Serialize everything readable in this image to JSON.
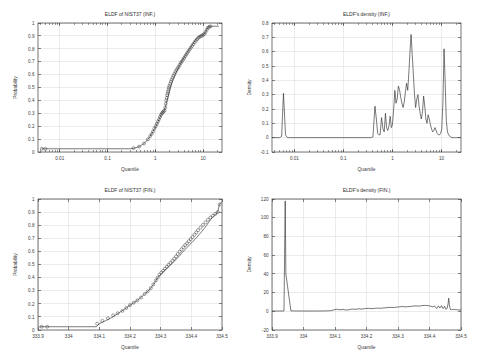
{
  "figure": {
    "width": 477,
    "height": 362,
    "background": "#ffffff",
    "line_color": "#303030",
    "grid_color": "#d8d8d8",
    "axis_color": "#3a3a3a",
    "text_color": "#3c3c3c"
  },
  "chart_data": [
    {
      "id": "ecdf-inf",
      "type": "line",
      "title": "ELDF of NIST37 (INF.)",
      "xlabel": "Quantile",
      "ylabel": "Probability",
      "xscale": "log",
      "yscale": "linear",
      "xlim": [
        0.0035,
        25
      ],
      "ylim": [
        0,
        1
      ],
      "grid": true,
      "xticks": [
        0.01,
        0.1,
        1,
        10
      ],
      "xtick_labels": [
        "0.01",
        "0.1",
        "1",
        "10"
      ],
      "yticks": [
        0,
        0.1,
        0.2,
        0.3,
        0.4,
        0.5,
        0.6,
        0.7,
        0.8,
        0.9,
        1
      ],
      "ytick_labels": [
        "0",
        "0.1",
        "0.2",
        "0.3",
        "0.4",
        "0.5",
        "0.6",
        "0.7",
        "0.8",
        "0.9",
        "1"
      ],
      "legend": null,
      "series": [
        {
          "name": "ECDF step curve",
          "style": "line",
          "x": [
            0.0042,
            0.0048,
            0.006,
            0.0075,
            0.3,
            0.34,
            0.38,
            0.42,
            0.46,
            0.5,
            0.54,
            0.58,
            0.62,
            0.66,
            0.7,
            0.74,
            0.78,
            0.82,
            0.86,
            0.9,
            0.95,
            1.0,
            1.05,
            1.1,
            1.16,
            1.22,
            1.28,
            1.34,
            1.4,
            1.47,
            1.54,
            1.62,
            1.7,
            1.78,
            1.87,
            1.96,
            2.05,
            2.15,
            2.26,
            2.37,
            2.49,
            2.61,
            2.74,
            2.88,
            3.02,
            3.17,
            3.33,
            3.5,
            3.67,
            3.86,
            4.05,
            4.25,
            4.47,
            4.69,
            4.93,
            5.17,
            5.43,
            5.71,
            6.0,
            6.3,
            6.62,
            6.95,
            7.3,
            7.67,
            8.06,
            8.47,
            8.9,
            9.35,
            9.83,
            10.33,
            10.85,
            11.4,
            11.98,
            12.59,
            13.23,
            13.9,
            14.6,
            15.34,
            16.12,
            18.5,
            21.0
          ],
          "y": [
            0.025,
            0.025,
            0.025,
            0.025,
            0.025,
            0.028,
            0.032,
            0.037,
            0.042,
            0.05,
            0.058,
            0.066,
            0.075,
            0.086,
            0.098,
            0.11,
            0.122,
            0.134,
            0.148,
            0.16,
            0.175,
            0.19,
            0.205,
            0.222,
            0.24,
            0.258,
            0.276,
            0.293,
            0.305,
            0.312,
            0.32,
            0.345,
            0.375,
            0.405,
            0.432,
            0.46,
            0.49,
            0.515,
            0.54,
            0.562,
            0.58,
            0.6,
            0.618,
            0.635,
            0.65,
            0.665,
            0.68,
            0.695,
            0.71,
            0.722,
            0.735,
            0.748,
            0.76,
            0.772,
            0.785,
            0.797,
            0.808,
            0.82,
            0.832,
            0.845,
            0.856,
            0.868,
            0.878,
            0.886,
            0.892,
            0.897,
            0.9,
            0.903,
            0.906,
            0.912,
            0.92,
            0.935,
            0.952,
            0.966,
            0.972,
            0.974,
            0.975,
            0.975,
            0.975,
            0.975,
            0.975
          ]
        },
        {
          "name": "ECDF sample markers",
          "style": "markers",
          "marker": "circle",
          "x": [
            0.0042,
            0.005,
            0.35,
            0.46,
            0.58,
            0.7,
            0.78,
            0.84,
            0.9,
            0.96,
            1.02,
            1.08,
            1.14,
            1.2,
            1.26,
            1.32,
            1.38,
            1.44,
            1.5,
            1.56,
            1.62,
            1.66,
            1.7,
            1.74,
            1.78,
            1.82,
            1.86,
            1.9,
            1.94,
            1.98,
            2.05,
            2.12,
            2.2,
            2.3,
            2.4,
            2.52,
            2.64,
            2.78,
            2.92,
            3.08,
            3.25,
            3.42,
            3.6,
            3.8,
            4.0,
            4.22,
            4.45,
            4.7,
            4.95,
            5.25,
            5.55,
            5.9,
            6.25,
            6.65,
            7.05,
            7.5,
            7.95,
            8.45,
            9.0,
            9.55,
            10.1,
            10.7,
            11.3,
            12.0,
            12.7,
            13.5,
            14.3
          ],
          "y": [
            0.025,
            0.025,
            0.03,
            0.042,
            0.066,
            0.098,
            0.122,
            0.14,
            0.16,
            0.182,
            0.2,
            0.218,
            0.236,
            0.254,
            0.272,
            0.288,
            0.3,
            0.308,
            0.315,
            0.322,
            0.345,
            0.375,
            0.4,
            0.42,
            0.44,
            0.455,
            0.47,
            0.485,
            0.5,
            0.512,
            0.528,
            0.545,
            0.56,
            0.575,
            0.59,
            0.605,
            0.62,
            0.635,
            0.648,
            0.66,
            0.675,
            0.69,
            0.702,
            0.715,
            0.728,
            0.742,
            0.755,
            0.768,
            0.782,
            0.795,
            0.808,
            0.822,
            0.836,
            0.85,
            0.862,
            0.874,
            0.884,
            0.892,
            0.898,
            0.902,
            0.908,
            0.916,
            0.93,
            0.948,
            0.962,
            0.97,
            0.974
          ]
        }
      ]
    },
    {
      "id": "density-inf",
      "type": "line",
      "title": "ELDF's density (INF.)",
      "xlabel": "Quantile",
      "ylabel": "Density",
      "xscale": "log",
      "yscale": "linear",
      "xlim": [
        0.0035,
        25
      ],
      "ylim": [
        -0.1,
        0.8
      ],
      "grid": true,
      "xticks": [
        0.01,
        0.1,
        1,
        10
      ],
      "xtick_labels": [
        "0.01",
        "0.1",
        "1",
        "10"
      ],
      "yticks": [
        -0.1,
        0,
        0.1,
        0.2,
        0.3,
        0.4,
        0.5,
        0.6,
        0.7,
        0.8
      ],
      "ytick_labels": [
        "-0.1",
        "0",
        "0.1",
        "0.2",
        "0.3",
        "0.4",
        "0.5",
        "0.6",
        "0.7",
        "0.8"
      ],
      "legend": null,
      "series": [
        {
          "name": "kernel density",
          "style": "line",
          "x": [
            0.0036,
            0.005,
            0.0055,
            0.006,
            0.0066,
            0.0072,
            0.008,
            0.01,
            0.02,
            0.05,
            0.1,
            0.2,
            0.3,
            0.36,
            0.4,
            0.44,
            0.47,
            0.5,
            0.53,
            0.56,
            0.6,
            0.64,
            0.68,
            0.72,
            0.76,
            0.8,
            0.85,
            0.9,
            0.95,
            1.0,
            1.06,
            1.12,
            1.18,
            1.25,
            1.32,
            1.4,
            1.48,
            1.56,
            1.65,
            1.74,
            1.84,
            1.94,
            2.05,
            2.16,
            2.28,
            2.4,
            2.53,
            2.67,
            2.82,
            2.97,
            3.14,
            3.31,
            3.49,
            3.68,
            3.88,
            4.1,
            4.32,
            4.56,
            4.81,
            5.07,
            5.35,
            5.64,
            5.95,
            6.28,
            6.62,
            6.98,
            7.36,
            7.77,
            8.19,
            8.64,
            9.11,
            9.61,
            10.14,
            10.7,
            11.28,
            11.9,
            12.55,
            13.24,
            13.97,
            14.73,
            15.54,
            16.39,
            17.29,
            18.23,
            19.23,
            20.5,
            22.0,
            24.0
          ],
          "y": [
            0.0,
            0.0,
            0.01,
            0.31,
            0.02,
            0.0,
            0.0,
            0.0,
            0.0,
            0.0,
            0.0,
            0.0,
            0.0,
            0.0,
            0.005,
            0.22,
            0.13,
            0.03,
            0.02,
            0.02,
            0.14,
            0.06,
            0.04,
            0.17,
            0.07,
            0.05,
            0.08,
            0.15,
            0.07,
            0.09,
            0.2,
            0.33,
            0.24,
            0.27,
            0.36,
            0.33,
            0.28,
            0.24,
            0.21,
            0.25,
            0.32,
            0.38,
            0.33,
            0.45,
            0.6,
            0.72,
            0.58,
            0.44,
            0.3,
            0.21,
            0.27,
            0.3,
            0.22,
            0.17,
            0.13,
            0.18,
            0.29,
            0.22,
            0.13,
            0.1,
            0.16,
            0.13,
            0.09,
            0.06,
            0.04,
            0.05,
            0.07,
            0.05,
            0.03,
            0.02,
            0.02,
            0.03,
            0.06,
            0.25,
            0.62,
            0.38,
            0.12,
            0.04,
            0.02,
            0.01,
            0.005,
            0.0,
            0.0,
            0.0,
            0.0,
            0.0,
            0.0,
            0.0
          ]
        }
      ]
    },
    {
      "id": "ecdf-fin",
      "type": "line",
      "title": "ELDF of NIST37 (FIN.)",
      "xlabel": "Quantile",
      "ylabel": "Probability",
      "xscale": "linear",
      "yscale": "linear",
      "xlim": [
        333.9,
        334.5
      ],
      "ylim": [
        0,
        1
      ],
      "grid": true,
      "xticks": [
        333.9,
        334.0,
        334.1,
        334.2,
        334.3,
        334.4,
        334.5
      ],
      "xtick_labels": [
        "333.9",
        "334",
        "334.1",
        "334.2",
        "334.3",
        "334.4",
        "334.5"
      ],
      "yticks": [
        0,
        0.1,
        0.2,
        0.3,
        0.4,
        0.5,
        0.6,
        0.7,
        0.8,
        0.9,
        1
      ],
      "ytick_labels": [
        "0",
        "0.1",
        "0.2",
        "0.3",
        "0.4",
        "0.5",
        "0.6",
        "0.7",
        "0.8",
        "0.9",
        "1"
      ],
      "legend": null,
      "series": [
        {
          "name": "ECDF step curve",
          "style": "line",
          "x": [
            333.905,
            333.92,
            333.935,
            334.09,
            334.1,
            334.11,
            334.12,
            334.13,
            334.14,
            334.15,
            334.16,
            334.17,
            334.18,
            334.19,
            334.2,
            334.21,
            334.22,
            334.23,
            334.24,
            334.25,
            334.258,
            334.266,
            334.274,
            334.282,
            334.29,
            334.298,
            334.306,
            334.314,
            334.322,
            334.33,
            334.338,
            334.346,
            334.354,
            334.362,
            334.37,
            334.378,
            334.386,
            334.394,
            334.402,
            334.41,
            334.418,
            334.426,
            334.434,
            334.442,
            334.45,
            334.456,
            334.462,
            334.468,
            334.474,
            334.48,
            334.486,
            334.492,
            334.498
          ],
          "y": [
            0.025,
            0.025,
            0.025,
            0.025,
            0.048,
            0.06,
            0.07,
            0.082,
            0.095,
            0.11,
            0.125,
            0.14,
            0.155,
            0.172,
            0.19,
            0.205,
            0.22,
            0.238,
            0.258,
            0.28,
            0.295,
            0.315,
            0.34,
            0.368,
            0.398,
            0.42,
            0.44,
            0.458,
            0.475,
            0.492,
            0.51,
            0.528,
            0.548,
            0.568,
            0.59,
            0.61,
            0.63,
            0.65,
            0.668,
            0.688,
            0.708,
            0.73,
            0.752,
            0.775,
            0.8,
            0.82,
            0.84,
            0.858,
            0.872,
            0.885,
            0.9,
            0.96,
            0.975
          ]
        },
        {
          "name": "ECDF sample markers",
          "style": "markers",
          "marker": "circle",
          "x": [
            333.912,
            333.93,
            334.093,
            334.11,
            334.128,
            334.145,
            334.16,
            334.175,
            334.188,
            334.2,
            334.212,
            334.224,
            334.236,
            334.248,
            334.258,
            334.268,
            334.276,
            334.284,
            334.29,
            334.296,
            334.302,
            334.308,
            334.314,
            334.32,
            334.326,
            334.332,
            334.338,
            334.344,
            334.35,
            334.356,
            334.362,
            334.368,
            334.374,
            334.38,
            334.386,
            334.392,
            334.398,
            334.404,
            334.41,
            334.416,
            334.422,
            334.43,
            334.438,
            334.446,
            334.454,
            334.462,
            334.47,
            334.478,
            334.486,
            334.492
          ],
          "y": [
            0.025,
            0.025,
            0.048,
            0.07,
            0.09,
            0.112,
            0.128,
            0.146,
            0.168,
            0.19,
            0.208,
            0.226,
            0.248,
            0.275,
            0.295,
            0.32,
            0.348,
            0.378,
            0.4,
            0.422,
            0.438,
            0.452,
            0.468,
            0.482,
            0.498,
            0.512,
            0.528,
            0.545,
            0.562,
            0.58,
            0.598,
            0.615,
            0.632,
            0.648,
            0.662,
            0.678,
            0.694,
            0.71,
            0.728,
            0.745,
            0.762,
            0.782,
            0.802,
            0.822,
            0.842,
            0.858,
            0.872,
            0.886,
            0.9,
            0.958
          ]
        }
      ]
    },
    {
      "id": "density-fin",
      "type": "line",
      "title": "ELDF's density (FIN.)",
      "xlabel": "Quantile",
      "ylabel": "Density",
      "xscale": "linear",
      "yscale": "linear",
      "xlim": [
        333.9,
        334.5
      ],
      "ylim": [
        -20,
        120
      ],
      "grid": true,
      "xticks": [
        333.9,
        334.0,
        334.1,
        334.2,
        334.3,
        334.4,
        334.5
      ],
      "xtick_labels": [
        "333.9",
        "334",
        "334.1",
        "334.2",
        "334.3",
        "334.4",
        "334.5"
      ],
      "yticks": [
        -20,
        0,
        20,
        40,
        60,
        80,
        100,
        120
      ],
      "ytick_labels": [
        "-20",
        "0",
        "20",
        "40",
        "60",
        "80",
        "100",
        "120"
      ],
      "legend": null,
      "series": [
        {
          "name": "kernel density",
          "style": "line",
          "x": [
            333.9,
            333.938,
            333.94,
            333.942,
            333.944,
            333.96,
            334.0,
            334.04,
            334.07,
            334.085,
            334.095,
            334.105,
            334.115,
            334.125,
            334.135,
            334.145,
            334.155,
            334.165,
            334.175,
            334.185,
            334.195,
            334.205,
            334.215,
            334.225,
            334.235,
            334.245,
            334.255,
            334.265,
            334.275,
            334.285,
            334.295,
            334.305,
            334.315,
            334.325,
            334.335,
            334.345,
            334.355,
            334.365,
            334.375,
            334.385,
            334.395,
            334.402,
            334.409,
            334.416,
            334.423,
            334.428,
            334.433,
            334.438,
            334.443,
            334.448,
            334.452,
            334.456,
            334.459,
            334.461,
            334.463,
            334.466,
            334.47,
            334.476,
            334.482,
            334.49,
            334.5
          ],
          "y": [
            0.3,
            0.3,
            60,
            118,
            40,
            0.4,
            0.3,
            0.3,
            0.4,
            0.6,
            1.4,
            2.2,
            1.6,
            2.0,
            1.3,
            1.7,
            2.4,
            2.1,
            2.6,
            2.3,
            2.9,
            3.2,
            2.8,
            3.1,
            3.4,
            3.2,
            3.6,
            3.9,
            4.2,
            4.0,
            4.4,
            4.8,
            5.1,
            4.7,
            5.0,
            5.4,
            5.8,
            5.5,
            6.0,
            6.3,
            6.1,
            5.6,
            4.8,
            5.6,
            3.0,
            5.8,
            3.4,
            6.0,
            2.8,
            5.4,
            2.2,
            3.0,
            8.0,
            14.0,
            7.0,
            2.0,
            1.6,
            2.2,
            1.8,
            1.5,
            1.3
          ]
        }
      ]
    }
  ]
}
